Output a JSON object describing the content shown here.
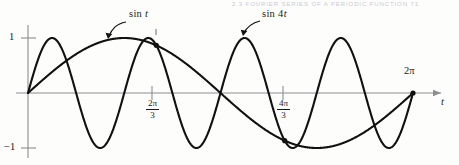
{
  "header": {
    "strip_text": "2.3  FOURIER SERIES OF A PERIODIC FUNCTION    71"
  },
  "figure": {
    "background_color": "#fdfdfc",
    "curve_color": "#111111",
    "axis_color": "#8d8d92",
    "marker_color": "#111111"
  },
  "callouts": [
    {
      "name": "sin-t",
      "prefix": "sin ",
      "variable": "t",
      "x": 130,
      "y": 14
    },
    {
      "name": "sin-4t",
      "prefix": "sin 4",
      "variable": "t",
      "x": 263,
      "y": 14
    }
  ],
  "axis_labels": {
    "y_top": "1",
    "y_bottom": "−1",
    "x_end": "2π",
    "x_variable": "t"
  },
  "x_ticks": [
    {
      "name": "two-pi-over-three",
      "numerator": "2π",
      "denominator": "3",
      "value_px": 152
    },
    {
      "name": "four-pi-over-three",
      "numerator": "4π",
      "denominator": "3",
      "value_px": 283
    }
  ],
  "chart_data": {
    "type": "line",
    "title": "",
    "subtitle": "",
    "xlabel": "t",
    "ylabel": "",
    "xlim": [
      0,
      6.283185307179586
    ],
    "ylim": [
      -1,
      1
    ],
    "grid": false,
    "legend": "inline-callouts",
    "x_tick_values": [
      2.0943951,
      4.1887902
    ],
    "x_tick_labels": [
      "2π/3",
      "4π/3"
    ],
    "y_tick_values": [
      1,
      -1
    ],
    "y_tick_labels": [
      "1",
      "−1"
    ],
    "axis_end_label": "2π",
    "series": [
      {
        "name": "sin t",
        "expression": "sin(t)",
        "frequency": 1,
        "amplitude": 1,
        "x": [
          0,
          0.3927,
          0.7854,
          1.1781,
          1.5708,
          1.9635,
          2.3562,
          2.7489,
          3.1416,
          3.5343,
          3.927,
          4.3197,
          4.7124,
          5.1051,
          5.4978,
          5.8905,
          6.2832
        ],
        "y": [
          0,
          0.383,
          0.707,
          0.924,
          1,
          0.924,
          0.707,
          0.383,
          0,
          -0.383,
          -0.707,
          -0.924,
          -1,
          -0.924,
          -0.707,
          -0.383,
          0
        ]
      },
      {
        "name": "sin 4t",
        "expression": "sin(4t)",
        "frequency": 4,
        "amplitude": 1,
        "x": [
          0,
          0.19635,
          0.3927,
          0.58905,
          0.7854,
          0.98175,
          1.1781,
          1.37445,
          1.5708,
          1.76715,
          1.9635,
          2.15985,
          2.3562,
          2.55255,
          2.7489,
          2.94525,
          3.1416,
          3.33795,
          3.5343,
          3.73065,
          3.927,
          4.12335,
          4.3197,
          4.51605,
          4.7124,
          4.90875,
          5.1051,
          5.30145,
          5.4978,
          5.69415,
          5.8905,
          6.08685,
          6.2832
        ],
        "y": [
          0,
          0.707,
          1,
          0.707,
          0,
          -0.707,
          -1,
          -0.707,
          0,
          0.707,
          1,
          0.707,
          0,
          -0.707,
          -1,
          -0.707,
          0,
          0.707,
          1,
          0.707,
          0,
          -0.707,
          -1,
          -0.707,
          0,
          0.707,
          1,
          0.707,
          0,
          -0.707,
          -1,
          -0.707,
          0
        ]
      }
    ],
    "intersection_markers": [
      {
        "name": "intersection-near-2pi-over-3",
        "x": 2.0943951,
        "y": 0.866
      },
      {
        "name": "intersection-near-4pi-over-3",
        "x": 4.1887902,
        "y": -0.866
      },
      {
        "name": "endpoint-2pi",
        "x": 6.2831853,
        "y": 0
      }
    ]
  }
}
